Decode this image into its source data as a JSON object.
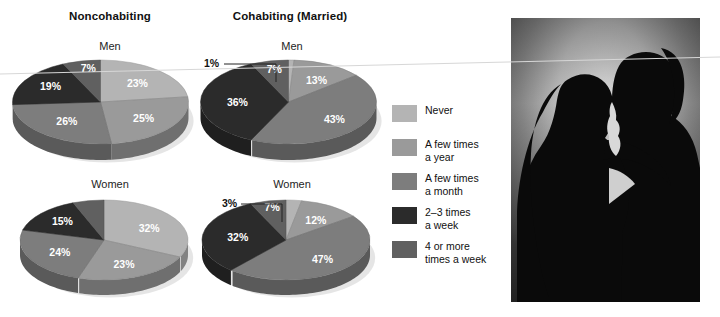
{
  "columns": [
    {
      "title": "Noncohabiting"
    },
    {
      "title": "Cohabiting (Married)"
    }
  ],
  "row_labels": {
    "men": "Men",
    "women": "Women"
  },
  "legend": {
    "items": [
      {
        "label": "Never",
        "color": "#b4b4b4"
      },
      {
        "label": "A few times\na year",
        "color": "#9a9a9a"
      },
      {
        "label": "A few times\na month",
        "color": "#7d7d7d"
      },
      {
        "label": "2–3 times\na week",
        "color": "#2b2b2b"
      },
      {
        "label": "4 or more\ntimes a week",
        "color": "#606060"
      }
    ]
  },
  "callouts": {
    "cohabiting_men": "1%",
    "cohabiting_women": "3%"
  },
  "photo": {
    "alt_name": "couple-silhouette-kissing-photo"
  },
  "chart_data": [
    {
      "type": "pie",
      "title": "Noncohabiting — Men",
      "group": "Noncohabiting",
      "subgroup": "Men",
      "categories": [
        "Never",
        "A few times a year",
        "A few times a month",
        "2–3 times a week",
        "4 or more times a week"
      ],
      "values": [
        23,
        25,
        26,
        19,
        7
      ],
      "labels": [
        "23%",
        "25%",
        "26%",
        "19%",
        "7%"
      ],
      "colors": [
        "#b4b4b4",
        "#9a9a9a",
        "#7d7d7d",
        "#2b2b2b",
        "#606060"
      ]
    },
    {
      "type": "pie",
      "title": "Cohabiting (Married) — Men",
      "group": "Cohabiting (Married)",
      "subgroup": "Men",
      "categories": [
        "Never",
        "A few times a year",
        "A few times a month",
        "2–3 times a week",
        "4 or more times a week"
      ],
      "values": [
        1,
        13,
        43,
        36,
        7
      ],
      "labels": [
        "1%",
        "13%",
        "43%",
        "36%",
        "7%"
      ],
      "colors": [
        "#b4b4b4",
        "#9a9a9a",
        "#7d7d7d",
        "#2b2b2b",
        "#606060"
      ]
    },
    {
      "type": "pie",
      "title": "Noncohabiting — Women",
      "group": "Noncohabiting",
      "subgroup": "Women",
      "categories": [
        "Never",
        "A few times a year",
        "A few times a month",
        "2–3 times a week",
        "4 or more times a week"
      ],
      "values": [
        32,
        23,
        24,
        15,
        6
      ],
      "labels": [
        "32%",
        "23%",
        "24%",
        "15%",
        ""
      ],
      "colors": [
        "#b4b4b4",
        "#9a9a9a",
        "#7d7d7d",
        "#2b2b2b",
        "#606060"
      ]
    },
    {
      "type": "pie",
      "title": "Cohabiting (Married) — Women",
      "group": "Cohabiting (Married)",
      "subgroup": "Women",
      "categories": [
        "Never",
        "A few times a year",
        "A few times a month",
        "2–3 times a week",
        "4 or more times a week"
      ],
      "values": [
        3,
        12,
        47,
        32,
        7
      ],
      "labels": [
        "3%",
        "12%",
        "47%",
        "32%",
        "7%"
      ],
      "colors": [
        "#b4b4b4",
        "#9a9a9a",
        "#7d7d7d",
        "#2b2b2b",
        "#606060"
      ]
    }
  ]
}
